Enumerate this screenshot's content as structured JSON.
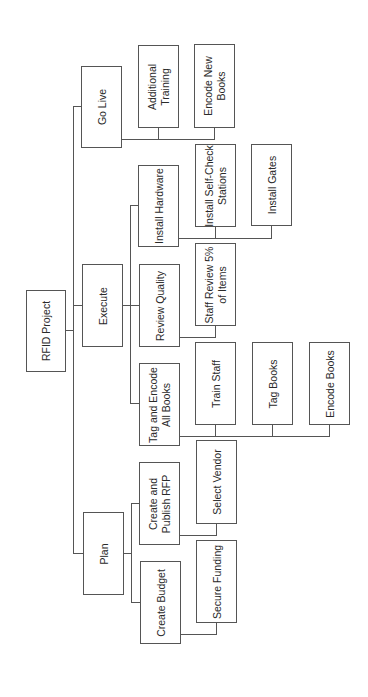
{
  "diagram": {
    "type": "work-breakdown-structure",
    "orientation": "rotated-90-ccw",
    "root": {
      "id": "rfid",
      "label": "RFID Project",
      "children": [
        {
          "id": "go_live",
          "label": "Go Live",
          "children": [
            {
              "id": "additional_training",
              "label": "Additional\nTraining"
            },
            {
              "id": "encode_new_books",
              "label": "Encode New\nBooks"
            }
          ]
        },
        {
          "id": "execute",
          "label": "Execute",
          "children": [
            {
              "id": "install_hardware",
              "label": "Install Hardware",
              "children": [
                {
                  "id": "install_selfcheck",
                  "label": "Install Self-Check\nStations"
                },
                {
                  "id": "install_gates",
                  "label": "Install Gates"
                }
              ]
            },
            {
              "id": "review_quality",
              "label": "Review Quality",
              "children": [
                {
                  "id": "staff_review",
                  "label": "Staff Review 5%\nof Items"
                }
              ]
            },
            {
              "id": "tag_encode",
              "label": "Tag and Encode\nAll Books",
              "children": [
                {
                  "id": "train_staff",
                  "label": "Train Staff"
                },
                {
                  "id": "tag_books",
                  "label": "Tag Books"
                },
                {
                  "id": "encode_books",
                  "label": "Encode Books"
                }
              ]
            }
          ]
        },
        {
          "id": "plan",
          "label": "Plan",
          "children": [
            {
              "id": "create_rfp",
              "label": "Create and\nPublish RFP",
              "children": [
                {
                  "id": "select_vendor",
                  "label": "Select Vendor"
                }
              ]
            },
            {
              "id": "create_budget",
              "label": "Create Budget",
              "children": [
                {
                  "id": "secure_funding",
                  "label": "Secure Funding"
                }
              ]
            }
          ]
        }
      ]
    }
  },
  "labels": {
    "rfid": "RFID Project",
    "go_live": "Go Live",
    "additional_training": "Additional\nTraining",
    "encode_new_books": "Encode New\nBooks",
    "execute": "Execute",
    "install_hardware": "Install Hardware",
    "install_selfcheck": "Install Self-Check\nStations",
    "install_gates": "Install Gates",
    "review_quality": "Review Quality",
    "staff_review": "Staff Review 5%\nof Items",
    "tag_encode": "Tag and Encode\nAll Books",
    "train_staff": "Train Staff",
    "tag_books": "Tag Books",
    "encode_books": "Encode Books",
    "plan": "Plan",
    "create_rfp": "Create and\nPublish RFP",
    "select_vendor": "Select Vendor",
    "create_budget": "Create Budget",
    "secure_funding": "Secure Funding"
  },
  "colors": {
    "border": "#555555",
    "text": "#2a2a2a",
    "background": "#ffffff"
  }
}
